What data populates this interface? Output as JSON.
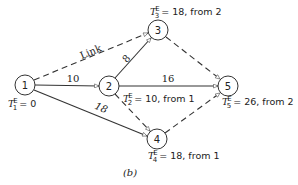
{
  "diagram": {
    "caption": "(b)",
    "nodes": [
      {
        "id": "1",
        "label": "1",
        "time_symbol": "T",
        "time_sub": "1",
        "time_sup": "E",
        "time_text": "= 0"
      },
      {
        "id": "2",
        "label": "2",
        "time_symbol": "T",
        "time_sub": "2",
        "time_sup": "E",
        "time_text": "= 10, from 1"
      },
      {
        "id": "3",
        "label": "3",
        "time_symbol": "T",
        "time_sub": "3",
        "time_sup": "E",
        "time_text": "= 18, from 2"
      },
      {
        "id": "4",
        "label": "4",
        "time_symbol": "T",
        "time_sub": "4",
        "time_sup": "E",
        "time_text": "= 18, from 1"
      },
      {
        "id": "5",
        "label": "5",
        "time_symbol": "T",
        "time_sub": "5",
        "time_sup": "E",
        "time_text": "= 26, from 2"
      }
    ],
    "edges": [
      {
        "from": "1",
        "to": "3",
        "style": "dashed",
        "label": "Link"
      },
      {
        "from": "1",
        "to": "2",
        "style": "solid",
        "label": "10"
      },
      {
        "from": "1",
        "to": "4",
        "style": "solid",
        "label": "18"
      },
      {
        "from": "2",
        "to": "3",
        "style": "solid",
        "label": "8"
      },
      {
        "from": "2",
        "to": "5",
        "style": "solid",
        "label": "16"
      },
      {
        "from": "2",
        "to": "4",
        "style": "dashed",
        "label": ""
      },
      {
        "from": "3",
        "to": "5",
        "style": "dashed",
        "label": ""
      },
      {
        "from": "4",
        "to": "5",
        "style": "dashed",
        "label": ""
      }
    ]
  }
}
